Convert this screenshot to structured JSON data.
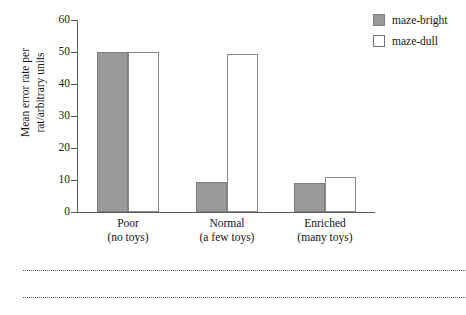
{
  "chart_data": {
    "type": "bar",
    "title": "",
    "subtitle": "",
    "xlabel": "",
    "ylabel": "Mean error rate per rat/arbitrary units",
    "ylabel_line1": "Mean error rate per",
    "ylabel_line2": "rat/arbitrary units",
    "ylim": [
      0,
      60
    ],
    "yticks": [
      0,
      10,
      20,
      30,
      40,
      50,
      60
    ],
    "ytick_labels": [
      "0",
      "10",
      "20",
      "30",
      "40",
      "50",
      "60"
    ],
    "grid": false,
    "legend_position": "top-right",
    "categories": [
      "Poor",
      "Normal",
      "Enriched"
    ],
    "category_sublabels": [
      "(no toys)",
      "(a few toys)",
      "(many toys)"
    ],
    "series": [
      {
        "name": "maze-bright",
        "color": "#9a9a9a",
        "edge_color": "#7d7d7d",
        "values": [
          50,
          9.5,
          9
        ]
      },
      {
        "name": "maze-dull",
        "color": "#ffffff",
        "edge_color": "#8a8a8a",
        "values": [
          50,
          49.5,
          11
        ]
      }
    ],
    "annotations": []
  },
  "legend": {
    "items": [
      {
        "label": "maze-bright",
        "swatch": "filled-gray-square"
      },
      {
        "label": "maze-dull",
        "swatch": "open-white-square"
      }
    ]
  },
  "axes": {
    "y_tick_labels": [
      "60",
      "50",
      "40",
      "30",
      "20",
      "10",
      "0"
    ],
    "y_title_line1": "Mean error rate per",
    "y_title_line2": "rat/arbitrary units"
  },
  "groups": [
    {
      "label": "Poor",
      "sublabel": "(no toys)"
    },
    {
      "label": "Normal",
      "sublabel": "(a few toys)"
    },
    {
      "label": "Enriched",
      "sublabel": "(many toys)"
    }
  ],
  "footer": {
    "rule_1": "",
    "rule_2": ""
  }
}
